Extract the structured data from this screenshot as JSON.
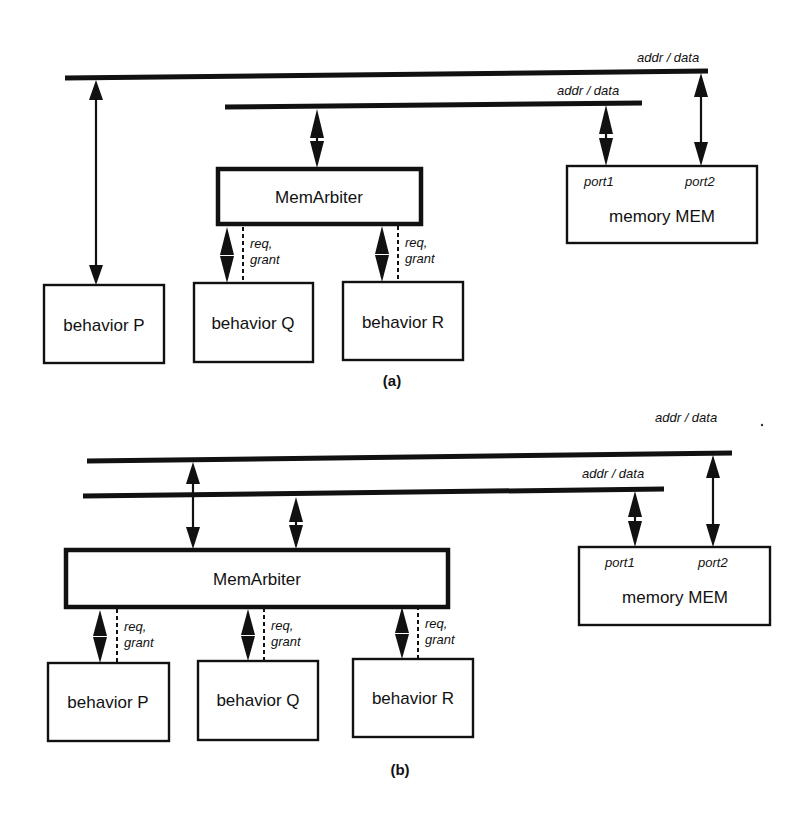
{
  "diagram_a": {
    "caption": "(a)",
    "buses": [
      {
        "label": "addr / data"
      },
      {
        "label": "addr / data"
      }
    ],
    "arbiter": {
      "label": "MemArbiter"
    },
    "behaviors": [
      {
        "label": "behavior P"
      },
      {
        "label": "behavior Q"
      },
      {
        "label": "behavior R"
      }
    ],
    "handshake": [
      {
        "line1": "req,",
        "line2": "grant"
      },
      {
        "line1": "req,",
        "line2": "grant"
      }
    ],
    "memory": {
      "label": "memory MEM",
      "port1": "port1",
      "port2": "port2"
    }
  },
  "diagram_b": {
    "caption": "(b)",
    "buses": [
      {
        "label": "addr / data"
      },
      {
        "label": "addr / data"
      }
    ],
    "arbiter": {
      "label": "MemArbiter"
    },
    "behaviors": [
      {
        "label": "behavior P"
      },
      {
        "label": "behavior Q"
      },
      {
        "label": "behavior R"
      }
    ],
    "handshake": [
      {
        "line1": "req,",
        "line2": "grant"
      },
      {
        "line1": "req,",
        "line2": "grant"
      },
      {
        "line1": "req,",
        "line2": "grant"
      }
    ],
    "memory": {
      "label": "memory MEM",
      "port1": "port1",
      "port2": "port2"
    }
  }
}
